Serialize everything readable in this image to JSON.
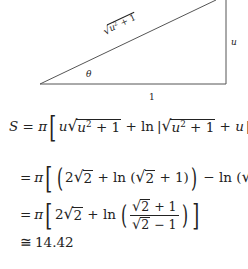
{
  "diagram": {
    "hypotenuse_label": "√u²+1",
    "hyp_radicand": "u",
    "hyp_exp": "2",
    "hyp_rest": " + 1",
    "angle_label": "θ",
    "vertical_label": "u",
    "base_label": "1",
    "vertices": {
      "left": [
        40,
        84
      ],
      "bottom_right": [
        226,
        84
      ],
      "top_right": [
        226,
        0
      ]
    }
  },
  "equations": {
    "line1": {
      "lhs": "S",
      "eq": " = ",
      "pi": "π",
      "t1": "u",
      "rad1_var": "u",
      "rad1_exp": "2",
      "rad1_rest": " + 1",
      "plus_ln": " + ln",
      "abs_bar": "|",
      "rad2_var": "u",
      "rad2_exp": "2",
      "rad2_rest": " + 1",
      "plus_u": " + u",
      "upper": "1",
      "lower": "−1"
    },
    "line2": {
      "eq": "=",
      "pi": "π",
      "two": "2",
      "r1": "2",
      "ln_a": " + ln (",
      "r2": "2",
      "close_a": " + 1)",
      "minus_ln": " − ln (",
      "r3": "2",
      "close_b": " − 1)"
    },
    "line3": {
      "eq": "=",
      "pi": "π",
      "two": "2",
      "r1": "2",
      "ln": " + ln",
      "num_r": "2",
      "num_rest": " + 1",
      "den_r": "2",
      "den_rest": " − 1"
    },
    "line4": {
      "approx": "≅",
      "value": "14.42"
    }
  }
}
